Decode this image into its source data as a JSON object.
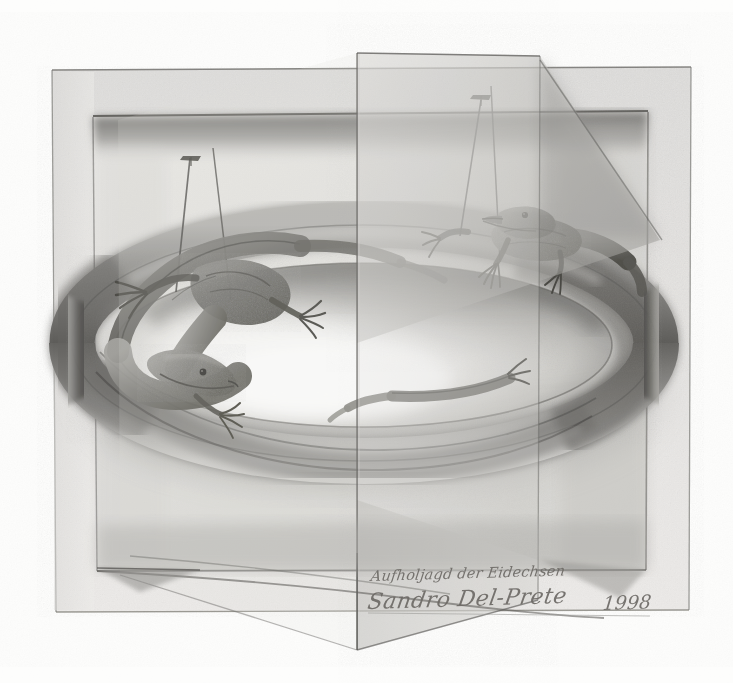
{
  "artwork": {
    "title_handwritten": "Aufholjagd der Eidechsen",
    "artist_signature": "Sandro Del-Prete",
    "year": "1998",
    "medium_description": "graphite pencil drawing",
    "subject": "two lizards chasing each other around an impossible folded ring",
    "background_color": "#fdfdfc",
    "paper_tone": "#f4f3f1",
    "frame_light": "#e6e5e3",
    "frame_mid": "#d2d1ce",
    "frame_shadow": "#8f8e8b",
    "ring_dark": "#6f6e6b",
    "ring_mid": "#a3a2a0",
    "ring_light": "#ececea",
    "graphite": "#5b5a57",
    "graphite_deep": "#3c3b39",
    "ink": "#6d6a66"
  },
  "composition": {
    "outer_frame": {
      "label": "outer paper frame",
      "top": 67,
      "left": 52,
      "right": 692,
      "bottom": 612
    },
    "inner_panel": {
      "label": "inner recessed panel",
      "top": 115,
      "left": 92,
      "right": 648,
      "bottom": 571
    },
    "fold_panel": {
      "label": "vertical folded leaf",
      "top": 53,
      "bottom": 650,
      "hinge_x": 357
    },
    "ring": {
      "label": "impossible torus ring",
      "cx": 364,
      "cy": 343,
      "rx": 292,
      "ry": 118,
      "tube": 46
    }
  },
  "elements": {
    "lizard_left": {
      "name": "left lizard",
      "description": "lizard head pointing down-right, body coiled over the ring top-left"
    },
    "lizard_right": {
      "name": "right lizard",
      "description": "lizard perched on ring crest facing right"
    },
    "post_left_a": {
      "name": "thin pin post left-outer"
    },
    "post_left_b": {
      "name": "thin wire left-inner"
    },
    "post_right_a": {
      "name": "thin pin post right-outer"
    },
    "post_right_b": {
      "name": "thin wire right-inner"
    }
  }
}
